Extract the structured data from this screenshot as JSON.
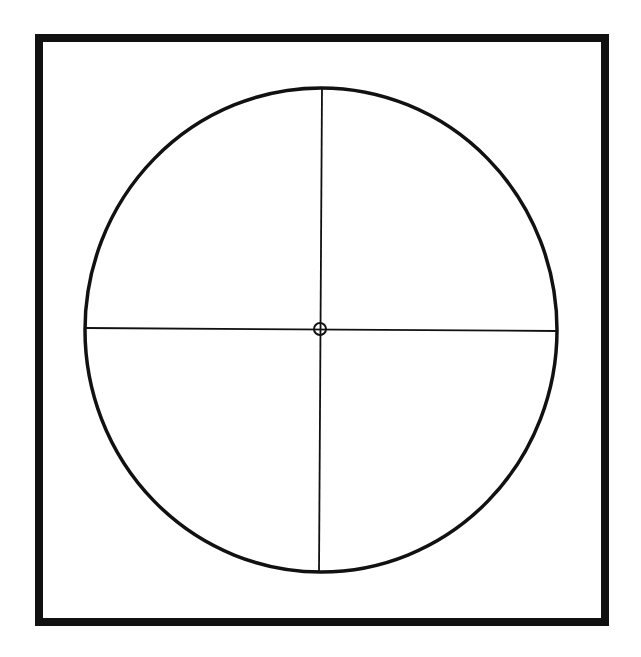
{
  "canvas": {
    "width": 641,
    "height": 657,
    "background": "#ffffff"
  },
  "frame": {
    "x": 39,
    "y": 38,
    "width": 566,
    "height": 584,
    "stroke": "#111111",
    "stroke_width": 8
  },
  "circle": {
    "cx": 321,
    "cy": 330,
    "rx": 236,
    "ry": 242,
    "stroke": "#111111",
    "stroke_width": 3.5
  },
  "crosshair": {
    "horizontal": {
      "x1": 85,
      "y1": 328,
      "x2": 557,
      "y2": 331
    },
    "vertical": {
      "x1": 322,
      "y1": 88,
      "x2": 319,
      "y2": 573
    },
    "stroke": "#111111",
    "stroke_width": 1.8
  },
  "center_marker": {
    "cx": 320,
    "cy": 329,
    "r": 6,
    "stroke": "#111111",
    "stroke_width": 2
  }
}
